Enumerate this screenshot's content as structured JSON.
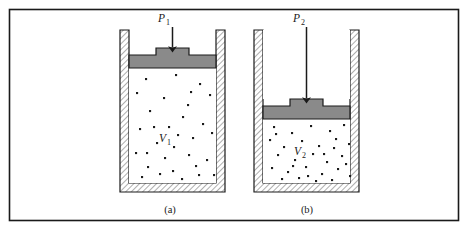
{
  "figure": {
    "frame": {
      "color": "#1a1a1a",
      "x": 9,
      "y": 9,
      "width": 450,
      "height": 212
    },
    "colors": {
      "outline": "#1a1a1a",
      "piston_fill": "#8a8a8a",
      "hatch_line": "#6b6b6b",
      "wall_fill": "#ffffff",
      "gas_molecule": "#1a1a1a",
      "background": "#ffffff"
    }
  },
  "panels": [
    {
      "id": "panel-a",
      "caption": "(a)",
      "caption_x": 170,
      "caption_y": 213,
      "pressure_label": {
        "symbol": "P",
        "subscript": "1",
        "x": 166,
        "y": 22
      },
      "volume_label": {
        "symbol": "V",
        "subscript": "1",
        "x": 166,
        "y": 142
      },
      "arrow": {
        "x": 172,
        "y_start": 27,
        "y_end": 53
      },
      "vessel": {
        "outer_x": 120,
        "outer_y": 30,
        "outer_w": 105,
        "outer_h": 162,
        "wall_thickness": 9
      },
      "piston": {
        "x": 129,
        "y": 55,
        "w": 87,
        "h": 13,
        "knob_x": 156,
        "knob_y": 48,
        "knob_w": 33,
        "knob_h": 7
      },
      "gas_region": {
        "x": 129,
        "y": 68,
        "w": 87,
        "h": 115
      },
      "molecules": [
        [
          18,
          12
        ],
        [
          48,
          8
        ],
        [
          72,
          17
        ],
        [
          9,
          26
        ],
        [
          36,
          31
        ],
        [
          60,
          38
        ],
        [
          82,
          28
        ],
        [
          22,
          44
        ],
        [
          55,
          50
        ],
        [
          75,
          57
        ],
        [
          12,
          62
        ],
        [
          41,
          60
        ],
        [
          65,
          71
        ],
        [
          84,
          66
        ],
        [
          29,
          76
        ],
        [
          50,
          68
        ],
        [
          8,
          86
        ],
        [
          37,
          91
        ],
        [
          61,
          88
        ],
        [
          79,
          93
        ],
        [
          20,
          100
        ],
        [
          45,
          104
        ],
        [
          68,
          99
        ],
        [
          86,
          108
        ],
        [
          14,
          110
        ],
        [
          32,
          107
        ],
        [
          54,
          112
        ],
        [
          71,
          108
        ],
        [
          26,
          60
        ],
        [
          46,
          80
        ],
        [
          63,
          25
        ],
        [
          19,
          86
        ]
      ]
    },
    {
      "id": "panel-b",
      "caption": "(b)",
      "caption_x": 307,
      "caption_y": 213,
      "pressure_label": {
        "symbol": "P",
        "subscript": "2",
        "x": 301,
        "y": 22
      },
      "volume_label": {
        "symbol": "V",
        "subscript": "2",
        "x": 301,
        "y": 155
      },
      "arrow": {
        "x": 307,
        "y_start": 27,
        "y_end": 104
      },
      "vessel": {
        "outer_x": 254,
        "outer_y": 30,
        "outer_w": 105,
        "outer_h": 162,
        "wall_thickness": 9
      },
      "piston": {
        "x": 263,
        "y": 106,
        "w": 87,
        "h": 13,
        "knob_x": 290,
        "knob_y": 99,
        "knob_w": 33,
        "knob_h": 7
      },
      "gas_region": {
        "x": 263,
        "y": 119,
        "w": 87,
        "h": 64
      },
      "molecules": [
        [
          10,
          7
        ],
        [
          28,
          13
        ],
        [
          47,
          6
        ],
        [
          66,
          11
        ],
        [
          80,
          5
        ],
        [
          6,
          20
        ],
        [
          20,
          27
        ],
        [
          38,
          21
        ],
        [
          55,
          26
        ],
        [
          72,
          19
        ],
        [
          85,
          24
        ],
        [
          14,
          35
        ],
        [
          31,
          40
        ],
        [
          49,
          34
        ],
        [
          63,
          42
        ],
        [
          78,
          36
        ],
        [
          8,
          48
        ],
        [
          24,
          52
        ],
        [
          42,
          47
        ],
        [
          58,
          54
        ],
        [
          74,
          49
        ],
        [
          86,
          56
        ],
        [
          18,
          59
        ],
        [
          35,
          58
        ],
        [
          52,
          61
        ],
        [
          68,
          60
        ],
        [
          82,
          44
        ],
        [
          12,
          14
        ],
        [
          60,
          34
        ],
        [
          44,
          56
        ],
        [
          29,
          46
        ],
        [
          70,
          28
        ]
      ]
    }
  ]
}
